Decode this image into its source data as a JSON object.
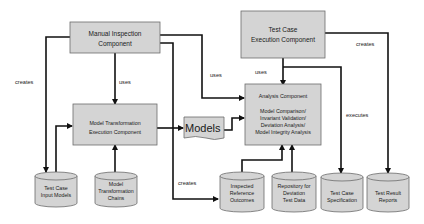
{
  "diagram": {
    "components": {
      "manual_inspection": {
        "lines": [
          "Manual Inspection",
          "Component"
        ]
      },
      "test_case_execution": {
        "lines": [
          "Test Case",
          "Execution Component"
        ]
      },
      "model_transformation": {
        "lines": [
          "Model Transformation",
          "Execution Component"
        ]
      },
      "analysis": {
        "title": "Analysis Component",
        "lines": [
          "Model Comparison/",
          "Invariant Validation/",
          "Deviation Analysis/",
          "Model Integrity Analysis"
        ]
      },
      "models": {
        "label": "Models"
      }
    },
    "stores": {
      "test_case_input_models": {
        "lines": [
          "Test Case",
          "Input Models"
        ]
      },
      "model_transformation_chains": {
        "lines": [
          "Model",
          "Transformation",
          "Chains"
        ]
      },
      "inspected_reference_outcomes": {
        "lines": [
          "Inspected",
          "Reference",
          "Outcomes"
        ]
      },
      "repository_deviation": {
        "lines": [
          "Repository for",
          "Deviation",
          "Test Data"
        ]
      },
      "test_case_specification": {
        "lines": [
          "Test Case",
          "Specification"
        ]
      },
      "test_result_reports": {
        "lines": [
          "Test Result",
          "Reports"
        ]
      }
    },
    "edge_labels": {
      "manual_creates_input": "creates",
      "manual_uses_transformation": "uses",
      "manual_uses_analysis": "uses",
      "execution_uses_analysis": "uses",
      "execution_creates_reports": "creates",
      "execution_executes_spec": "executes",
      "manual_creates_reference": "creates"
    },
    "colors": {
      "box_fill": "#d4d4d4",
      "edge": "#111111",
      "background": "#ffffff"
    }
  }
}
